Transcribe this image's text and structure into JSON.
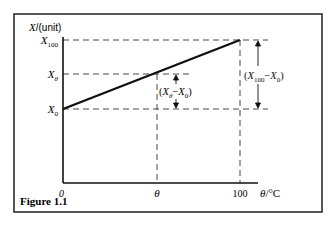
{
  "figure": {
    "caption": "Figure 1.1",
    "y_axis_label_var": "X",
    "y_axis_label_unit": "/(unit)",
    "x_axis_label_var": "θ",
    "x_axis_label_unit": "/°C",
    "y_ticks": {
      "x100": {
        "base": "X",
        "sub": "100"
      },
      "xtheta": {
        "base": "X",
        "sub": "θ"
      },
      "x0": {
        "base": "X",
        "sub": "0"
      }
    },
    "x_ticks": {
      "zero": "0",
      "theta": "θ",
      "hundred": "100"
    },
    "annotations": {
      "small_diff": {
        "open": "(",
        "a": "X",
        "a_sub": "θ",
        "minus": "−",
        "b": "X",
        "b_sub": "0",
        "close": ")"
      },
      "large_diff": {
        "open": "(",
        "a": "X",
        "a_sub": "100",
        "minus": "−",
        "b": "X",
        "b_sub": "0",
        "close": ")"
      }
    }
  }
}
